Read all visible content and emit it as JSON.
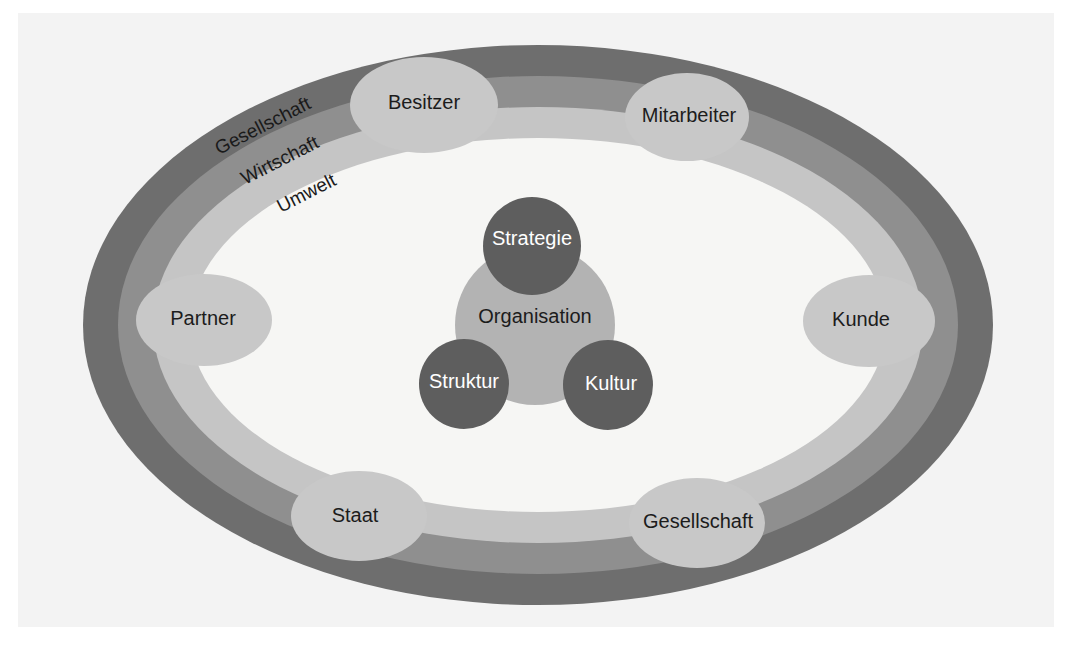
{
  "diagram": {
    "type": "concentric-ellipse-stakeholder-diagram",
    "background_color": "#ffffff",
    "plate_color": "#f3f3f3"
  },
  "rings": [
    {
      "label": "Gesellschaft",
      "level": 1,
      "position": "outer",
      "color": "#6e6e6e",
      "rx": 455,
      "ry": 280
    },
    {
      "label": "Wirtschaft",
      "level": 2,
      "position": "middle",
      "color": "#8f8f8f",
      "rx": 420,
      "ry": 249
    },
    {
      "label": "Umwelt",
      "level": 3,
      "position": "inner",
      "color": "#c5c5c5",
      "rx": 385,
      "ry": 218
    }
  ],
  "inner_field": {
    "name": "inner-white-oval",
    "color": "#f6f6f4",
    "rx": 348,
    "ry": 187
  },
  "core": {
    "center_label": "Organisation",
    "center_color": "#b3b3b3",
    "node_color": "#5e5e5e",
    "nodes": [
      {
        "label": "Strategie",
        "position": "top"
      },
      {
        "label": "Struktur",
        "position": "bottom-left"
      },
      {
        "label": "Kultur",
        "position": "bottom-right"
      }
    ]
  },
  "stakeholders": [
    {
      "label": "Besitzer",
      "position": "top-left",
      "cx": 424,
      "cy": 105,
      "rx": 74,
      "ry": 48
    },
    {
      "label": "Mitarbeiter",
      "position": "top-right",
      "cx": 687,
      "cy": 117,
      "rx": 60,
      "ry": 43
    },
    {
      "label": "Kunde",
      "position": "right",
      "cx": 869,
      "cy": 321,
      "rx": 66,
      "ry": 46
    },
    {
      "label": "Gesellschaft",
      "position": "bottom-right",
      "cx": 697,
      "cy": 523,
      "rx": 68,
      "ry": 45
    },
    {
      "label": "Staat",
      "position": "bottom-left",
      "cx": 359,
      "cy": 516,
      "rx": 68,
      "ry": 45
    },
    {
      "label": "Partner",
      "position": "left",
      "cx": 204,
      "cy": 320,
      "rx": 68,
      "ry": 46
    }
  ],
  "stakeholder_style": {
    "fill": "#c8c8c8",
    "text_color": "#1c1c1c"
  }
}
